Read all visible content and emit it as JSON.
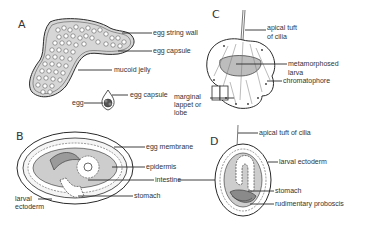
{
  "panels": {
    "A": {
      "letter": "A",
      "labels": {
        "egg_string_wall": "egg string wall",
        "egg_capsule_top": "egg capsule",
        "mucoid_jelly": "mucoid jelly",
        "egg": "egg",
        "egg_capsule_single": "egg capsule"
      }
    },
    "B": {
      "letter": "B",
      "labels": {
        "egg_membrane": "egg membrane",
        "epidermis": "epidermis",
        "intestine": "intestine",
        "stomach": "stomach",
        "larval_ectoderm_1": "larval",
        "larval_ectoderm_2": "ectoderm"
      }
    },
    "C": {
      "letter": "C",
      "labels": {
        "apical_tuft_1": "apical tuft",
        "apical_tuft_2": "of cilia",
        "metamorphosed_1": "metamorphosed",
        "metamorphosed_2": "larva",
        "chromatophore": "chromatophore",
        "marginal_1": "marginal",
        "marginal_2": "lappet or",
        "marginal_3": "lobe"
      }
    },
    "D": {
      "letter": "D",
      "labels": {
        "apical_tuft": "apical tuft of cilia",
        "larval_ectoderm": "larval ectoderm",
        "stomach": "stomach",
        "rudimentary_proboscis": "rudimentary proboscis"
      }
    }
  },
  "colors": {
    "line": "#2a2a2a",
    "shade": "#cfcfcf",
    "shade_light": "#e4e4e4",
    "background": "#ffffff"
  }
}
